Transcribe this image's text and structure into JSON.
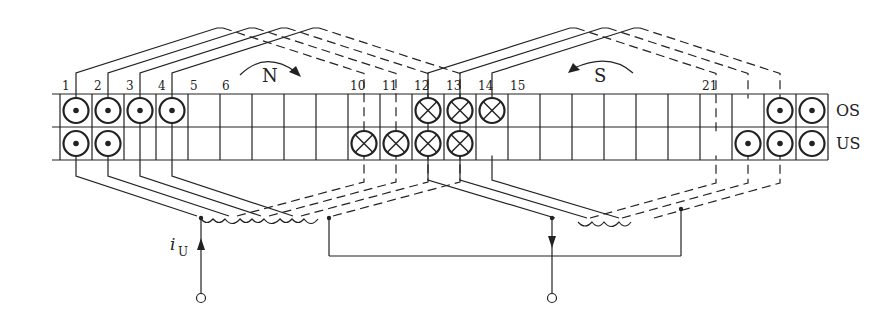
{
  "diagram": {
    "slot_labels": [
      {
        "slot": 1,
        "label": "1"
      },
      {
        "slot": 2,
        "label": "2"
      },
      {
        "slot": 3,
        "label": "3"
      },
      {
        "slot": 4,
        "label": "4"
      },
      {
        "slot": 5,
        "label": "5"
      },
      {
        "slot": 6,
        "label": "6"
      },
      {
        "slot": 10,
        "label": "10"
      },
      {
        "slot": 11,
        "label": "11"
      },
      {
        "slot": 12,
        "label": "12"
      },
      {
        "slot": 13,
        "label": "13"
      },
      {
        "slot": 14,
        "label": "14"
      },
      {
        "slot": 15,
        "label": "15"
      },
      {
        "slot": 21,
        "label": "21"
      }
    ],
    "total_slots": 24,
    "layers": {
      "top": "OS",
      "bottom": "US"
    },
    "poles": [
      {
        "name": "N",
        "rotation": "clockwise"
      },
      {
        "name": "S",
        "rotation": "counterclockwise"
      }
    ],
    "conductors": {
      "top_dot": [
        1,
        2,
        3,
        4,
        23,
        24
      ],
      "bottom_dot": [
        1,
        2,
        22,
        23,
        24
      ],
      "top_cross": [
        12,
        13,
        14
      ],
      "bottom_cross": [
        10,
        11,
        12,
        13
      ]
    },
    "current_label": "i",
    "current_subscript": "U",
    "line_color": "#222222"
  }
}
